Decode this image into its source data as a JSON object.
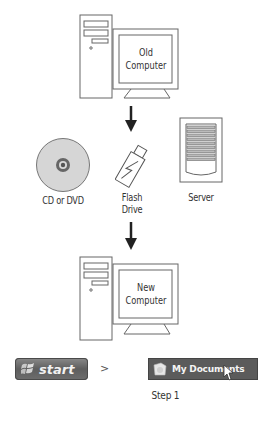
{
  "diagram": {
    "nodes": {
      "old_computer": {
        "label_line1": "Old",
        "label_line2": "Computer"
      },
      "cd_dvd": {
        "label": "CD or DVD"
      },
      "flash_drive": {
        "label_line1": "Flash",
        "label_line2": "Drive"
      },
      "server": {
        "label": "Server"
      },
      "new_computer": {
        "label_line1": "New",
        "label_line2": "Computer"
      }
    },
    "edges": [
      {
        "from": "old_computer",
        "to": "transfer_media",
        "type": "arrow-down"
      },
      {
        "from": "transfer_media",
        "to": "new_computer",
        "type": "arrow-down"
      }
    ]
  },
  "step_bar": {
    "start_label": "start",
    "separator": ">",
    "menu_item_label": "My Documents",
    "step_caption": "Step 1"
  },
  "colors": {
    "line": "#555555",
    "disc_fill": "#d6d6d6",
    "button_bg": "#5b5b5b",
    "button_text": "#f4f4f4"
  }
}
